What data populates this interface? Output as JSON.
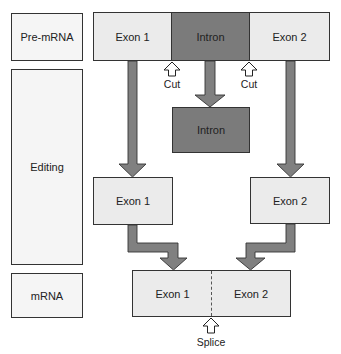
{
  "stages": {
    "pre_mrna": "Pre-mRNA",
    "editing": "Editing",
    "mrna": "mRNA"
  },
  "pre_mrna_strand": {
    "exon1": "Exon 1",
    "intron": "Intron",
    "exon2": "Exon 2"
  },
  "cut_sites": {
    "left": "Cut",
    "right": "Cut"
  },
  "removed_intron": "Intron",
  "separated_exons": {
    "exon1": "Exon 1",
    "exon2": "Exon 2"
  },
  "mature_mrna": {
    "exon1": "Exon 1",
    "exon2": "Exon 2"
  },
  "splice_label": "Splice",
  "colors": {
    "exon_fill": "#ebebeb",
    "intron_fill": "#7b7b7b",
    "arrow_fill": "#808080",
    "outline": "#333333"
  }
}
